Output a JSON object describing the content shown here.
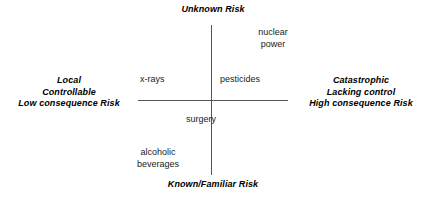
{
  "chart_data": {
    "type": "scatter",
    "title": "",
    "xlabel": "",
    "ylabel": "",
    "grid": false,
    "legend": "none",
    "axes": {
      "vertical": {
        "top_pole": "Unknown Risk",
        "bottom_pole": "Known/Familiar Risk"
      },
      "horizontal": {
        "left_pole": [
          "Local",
          "Controllable",
          "Low consequence Risk"
        ],
        "right_pole": [
          "Catastrophic",
          "Lacking control",
          "High consequence Risk"
        ]
      }
    },
    "points": [
      {
        "label": "nuclear power",
        "lines": [
          "nuclear",
          "power"
        ],
        "quadrant": "upper-right",
        "x": 0.72,
        "y": 0.82
      },
      {
        "label": "pesticides",
        "lines": [
          "pesticides"
        ],
        "quadrant": "upper-right",
        "x": 0.18,
        "y": 0.3
      },
      {
        "label": "x-rays",
        "lines": [
          "x-rays"
        ],
        "quadrant": "upper-left",
        "x": -0.42,
        "y": 0.3
      },
      {
        "label": "surgery",
        "lines": [
          "surgery"
        ],
        "quadrant": "lower-left",
        "x": -0.18,
        "y": -0.2
      },
      {
        "label": "alcoholic beverages",
        "lines": [
          "alcoholic",
          "beverages"
        ],
        "quadrant": "lower-left",
        "x": -0.56,
        "y": -0.62
      }
    ]
  },
  "diagram": {
    "poles": {
      "top": "Unknown Risk",
      "bottom": "Known/Familiar Risk",
      "left": {
        "line1": "Local",
        "line2": "Controllable",
        "line3": "Low consequence Risk"
      },
      "right": {
        "line1": "Catastrophic",
        "line2": "Lacking control",
        "line3": "High consequence Risk"
      }
    },
    "items": {
      "nuclear_power": {
        "line1": "nuclear",
        "line2": "power"
      },
      "pesticides": {
        "line1": "pesticides"
      },
      "xrays": {
        "line1": "x-rays"
      },
      "surgery": {
        "line1": "surgery"
      },
      "alcoholic_beverages": {
        "line1": "alcoholic",
        "line2": "beverages"
      }
    }
  },
  "colors": {
    "background": "#ffffff",
    "text": "#000000",
    "item_text": "#1a1a1a",
    "axis_line": "#555555"
  }
}
